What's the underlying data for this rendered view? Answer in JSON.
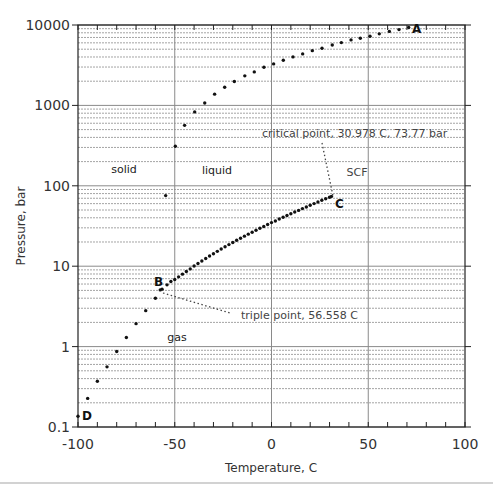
{
  "chart_data": {
    "type": "scatter",
    "title": "",
    "xlabel": "Temperature, C",
    "ylabel": "Pressure, bar",
    "xlim": [
      -100,
      100
    ],
    "ylim": [
      0.1,
      10000
    ],
    "yscale": "log",
    "grid": true,
    "x_ticks": [
      -100,
      -50,
      0,
      50,
      100
    ],
    "x_tick_labels": [
      "-100",
      "-50",
      "0",
      "50",
      "100"
    ],
    "y_ticks": [
      0.1,
      1,
      10,
      100,
      1000,
      10000
    ],
    "y_tick_labels": [
      "0.1",
      "1",
      "10",
      "100",
      "1000",
      "10000"
    ],
    "series": [
      {
        "name": "sublimation curve (D to B)",
        "x": [
          -100,
          -95,
          -90,
          -85,
          -80,
          -75,
          -70,
          -65,
          -60,
          -57.5
        ],
        "y": [
          0.136,
          0.227,
          0.37,
          0.56,
          0.87,
          1.3,
          1.93,
          2.8,
          4.0,
          5.07
        ]
      },
      {
        "name": "melting curve (B to A)",
        "x": [
          -54.7,
          -49.7,
          -44.9,
          -39.7,
          -34.5,
          -29.4,
          -24.2,
          -19.2,
          -13.8,
          -8.9,
          -3.9,
          1.1,
          6.1,
          11.1,
          16.1,
          21.1,
          26.1,
          31.4,
          36.1,
          41.1,
          45.9,
          50.9,
          55.7,
          60.9,
          65.9,
          70.9
        ],
        "y": [
          75.5,
          310,
          565,
          830,
          1070,
          1380,
          1680,
          1980,
          2330,
          2610,
          2980,
          3280,
          3640,
          4010,
          4370,
          4800,
          5130,
          5650,
          6040,
          6530,
          6840,
          7240,
          7760,
          8330,
          8770,
          9290
        ]
      },
      {
        "name": "vaporization curve (B to C)",
        "x": [
          -56.558,
          -54,
          -52,
          -50,
          -48,
          -46,
          -44,
          -42,
          -40,
          -38,
          -36,
          -34,
          -32,
          -30,
          -28,
          -26,
          -24,
          -22,
          -20,
          -18,
          -16,
          -14,
          -12,
          -10,
          -8,
          -6,
          -4,
          -2,
          0,
          2,
          4,
          6,
          8,
          10,
          12,
          14,
          16,
          18,
          20,
          22,
          24,
          26,
          28,
          30,
          30.978
        ],
        "y": [
          5.18,
          5.86,
          6.45,
          6.82,
          7.37,
          7.96,
          8.59,
          9.25,
          10.05,
          10.8,
          11.62,
          12.48,
          13.38,
          14.28,
          15.3,
          16.34,
          17.42,
          18.57,
          19.7,
          20.99,
          22.27,
          23.64,
          25.04,
          26.49,
          28.02,
          29.6,
          31.24,
          32.95,
          34.85,
          36.56,
          38.56,
          40.57,
          42.65,
          44.99,
          47.19,
          49.45,
          52.08,
          54.59,
          57.29,
          60.03,
          62.99,
          66.01,
          69.14,
          72.13,
          73.77
        ]
      }
    ],
    "annotations": [
      {
        "text": "A",
        "x": 72,
        "y": 9300,
        "role": "point-label"
      },
      {
        "text": "B",
        "x": -59.5,
        "y": 6.0,
        "role": "point-label"
      },
      {
        "text": "C",
        "x": 33,
        "y": 66,
        "role": "point-label"
      },
      {
        "text": "D",
        "x": -98,
        "y": 0.14,
        "role": "point-label"
      },
      {
        "text": "solid",
        "x": -80,
        "y": 150,
        "role": "region"
      },
      {
        "text": "liquid",
        "x": -37,
        "y": 150,
        "role": "region"
      },
      {
        "text": "SCF",
        "x": 39,
        "y": 145,
        "role": "region"
      },
      {
        "text": "gas",
        "x": -53,
        "y": 0.95,
        "role": "region"
      },
      {
        "text": "critical point, 30.978 C, 73.77 bar",
        "x": -19,
        "y": 450,
        "role": "callout"
      },
      {
        "text": "triple point, 56.558 C",
        "x": -16,
        "y": 2.5,
        "role": "callout"
      }
    ]
  },
  "labels": {
    "xlabel": "Temperature, C",
    "ylabel": "Pressure, bar",
    "solid": "solid",
    "liquid": "liquid",
    "scf": "SCF",
    "gas": "gas",
    "critical": "critical point, 30.978 C, 73.77 bar",
    "triple": "triple point, 56.558 C",
    "A": "A",
    "B": "B",
    "C": "C",
    "D": "D"
  },
  "colors": {
    "axis": "#222222",
    "grid_major": "#8a8a8a",
    "grid_minor": "#9a9a9a",
    "points": "#111111",
    "leader": "#444444",
    "separator": "#d2d2d2"
  }
}
